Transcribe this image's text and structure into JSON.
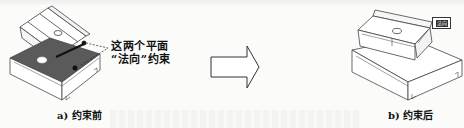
{
  "figure": {
    "left_panel": {
      "caption": "a) 约束前",
      "annotation_line1": "这两个平面",
      "annotation_line2": "“法向”约束"
    },
    "arrow": {
      "direction": "right",
      "icon": "hollow-right-arrow"
    },
    "right_panel": {
      "caption": "b) 约束后",
      "tag_label": "法向"
    },
    "colors": {
      "face_fill": "#5a5a5a",
      "line": "#333333",
      "background": "#fbfbfa"
    }
  }
}
